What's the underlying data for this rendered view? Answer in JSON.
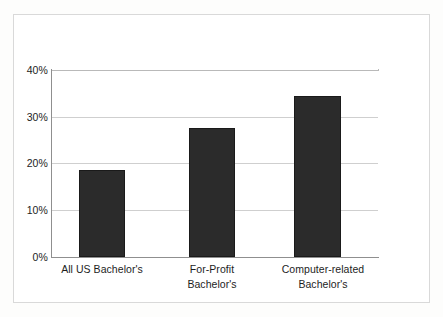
{
  "chart_data": {
    "type": "bar",
    "title": "",
    "subtitle": "",
    "xlabel": "",
    "ylabel": "",
    "categories": [
      "All US Bachelor's",
      "For-Profit Bachelor's",
      "Computer-related Bachelor's"
    ],
    "category_lines": [
      [
        "All US Bachelor's"
      ],
      [
        "For-Profit",
        "Bachelor's"
      ],
      [
        "Computer-related",
        "Bachelor's"
      ]
    ],
    "values": [
      18.6,
      27.5,
      34.5
    ],
    "value_labels": [
      "18.6%",
      "27.5%",
      "34.5%"
    ],
    "ylim": [
      0,
      40
    ],
    "yticks": [
      0,
      10,
      20,
      30,
      40
    ],
    "ytick_labels": [
      "0%",
      "10%",
      "20%",
      "30%",
      "40%"
    ],
    "grid": true,
    "grid_axis": "y",
    "legend": false,
    "legend_position": "none",
    "bar_color": "#2b2b2b",
    "bar_edge_color": "#1a1a1a",
    "gridline_color": "#cfcfcf",
    "axis_color": "#8f8f8f",
    "frame_color": "#d9d9d9",
    "background_color": "#ffffff"
  },
  "axis": {
    "y": {
      "ticks": [
        {
          "label": "40%",
          "value": 40
        },
        {
          "label": "30%",
          "value": 30
        },
        {
          "label": "20%",
          "value": 20
        },
        {
          "label": "10%",
          "value": 10
        },
        {
          "label": "0%",
          "value": 0
        }
      ]
    }
  }
}
